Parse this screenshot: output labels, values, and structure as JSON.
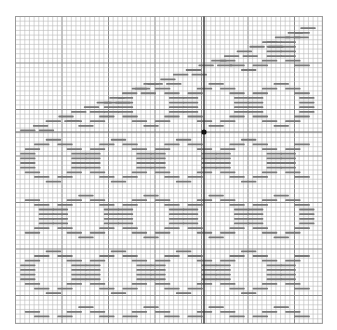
{
  "chart": {
    "title": "Knitting chart — ring lace motif",
    "grid": {
      "origin_x": 15.5,
      "origin_y": 16.5,
      "cols": 66,
      "rows": 66,
      "cell": 4.65,
      "major_every": 10,
      "minor_color": "#b9b9b9",
      "major_color": "#8a8a8a",
      "border_color": "#9a9a9a"
    },
    "center_marker": {
      "x": 204,
      "y": 132,
      "line_color": "#333333",
      "dot_color": "#111111",
      "dot_radius": 2.6
    },
    "guide_line_y": 132,
    "stitch_symbol": {
      "name": "dash",
      "color": "#7a7a7a",
      "length_cells": 3.3,
      "thickness": 1.8
    },
    "motif": {
      "type": "ring",
      "period_x": 14,
      "period_y": 12,
      "stagger_x": 7,
      "ring": [
        {
          "dy": 0,
          "dx": [
            -1.5
          ]
        },
        {
          "dy": 1,
          "dx": [
            -4,
            1
          ]
        },
        {
          "dy": 2,
          "dx": [
            -6,
            3
          ]
        },
        {
          "dy": 3,
          "dx": [
            -7,
            4
          ]
        },
        {
          "dy": 4,
          "dx": [
            -7,
            4
          ]
        },
        {
          "dy": 5,
          "dx": [
            -7,
            4
          ]
        },
        {
          "dy": 6,
          "dx": [
            -7,
            4
          ]
        },
        {
          "dy": 7,
          "dx": [
            -6,
            3
          ]
        },
        {
          "dy": 8,
          "dx": [
            -4,
            1
          ]
        },
        {
          "dy": 9,
          "dx": [
            -1.5
          ]
        }
      ],
      "diagonal_band": {
        "start_col": 64,
        "start_row": 1,
        "end_col": 1,
        "end_row": 24,
        "width_cols": 9
      },
      "blank_region": "below-left of diagonal"
    },
    "bounds": {
      "first_row": 1,
      "last_row": 64,
      "first_col": 1,
      "last_col": 64
    }
  }
}
